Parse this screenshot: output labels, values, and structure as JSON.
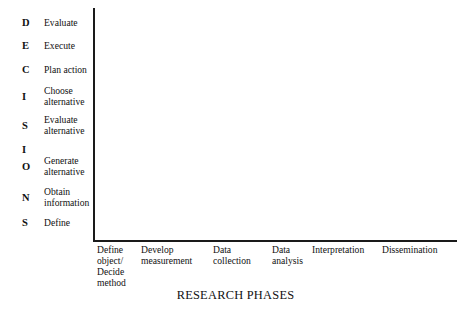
{
  "figure": {
    "background_color": "#ffffff",
    "axis_color": "#1a1a1a",
    "text_color": "#111111"
  },
  "chart_data": {
    "type": "table",
    "title": "",
    "xlabel": "RESEARCH PHASES",
    "ylabel": "DECISIONS",
    "grid": false,
    "legend": false,
    "series": [],
    "values": [],
    "note": "Empty plotting area: L-shaped axes with categorical labels only, no plotted data.",
    "y_axis": {
      "acronym": "DECISIONS",
      "direction": "top-to-bottom",
      "categories": [
        "Evaluate",
        "Execute",
        "Plan action",
        "Choose alternative",
        "Evaluate alternative",
        "Generate alternative",
        "Obtain information",
        "Define"
      ]
    },
    "x_axis": {
      "categories": [
        "Define object/ Decide method",
        "Develop measurement",
        "Data collection",
        "Data analysis",
        "Interpretation",
        "Dissemination"
      ]
    }
  },
  "decision_rows": [
    {
      "letter": "D",
      "line1": "Evaluate",
      "line2": "",
      "top": 16,
      "height": 14
    },
    {
      "letter": "E",
      "line1": "Execute",
      "line2": "",
      "top": 39,
      "height": 14
    },
    {
      "letter": "C",
      "line1": "Plan action",
      "line2": "",
      "top": 63,
      "height": 14
    },
    {
      "letter": "I",
      "line1": "Choose",
      "line2": "alternative",
      "top": 85,
      "height": 24
    },
    {
      "letter": "S",
      "line1": "Evaluate",
      "line2": "alternative",
      "top": 114,
      "height": 24
    },
    {
      "letter": "I",
      "line1": "",
      "line2": "",
      "top": 143,
      "height": 14
    },
    {
      "letter": "O",
      "line1": "Generate",
      "line2": "alternative",
      "top": 155,
      "height": 24
    },
    {
      "letter": "N",
      "line1": "Obtain",
      "line2": "information",
      "top": 186,
      "height": 24
    },
    {
      "letter": "S",
      "line1": "Define",
      "line2": "",
      "top": 216,
      "height": 14
    }
  ],
  "phase_labels": [
    {
      "lines": [
        "Define",
        "object/",
        "Decide",
        "method"
      ],
      "left": 97
    },
    {
      "lines": [
        "Develop",
        "measurement"
      ],
      "left": 141
    },
    {
      "lines": [
        "Data",
        "collection"
      ],
      "left": 213
    },
    {
      "lines": [
        "Data",
        "analysis"
      ],
      "left": 272
    },
    {
      "lines": [
        "Interpretation"
      ],
      "left": 312
    },
    {
      "lines": [
        "Dissemination"
      ],
      "left": 382
    }
  ],
  "axis_title": {
    "text": "RESEARCH PHASES"
  }
}
